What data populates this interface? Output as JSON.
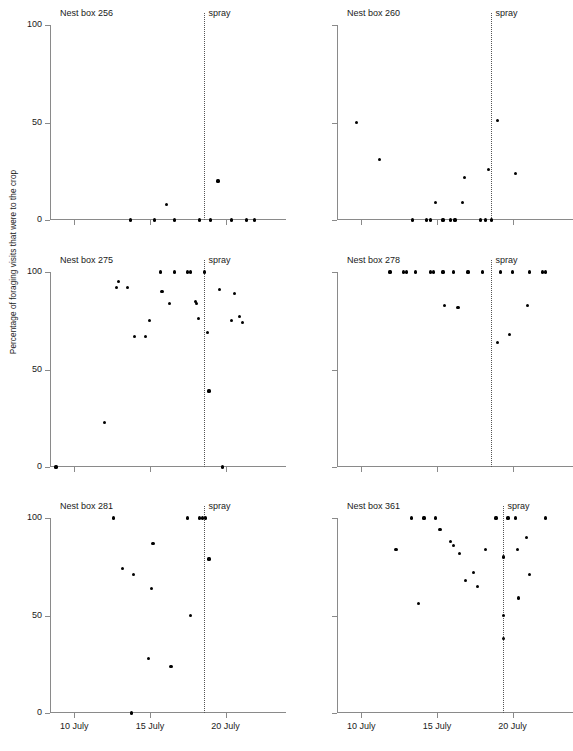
{
  "figure": {
    "caption_remnant": "",
    "y_axis_title": "Percentage of foraging visits that were to the crop",
    "spray_label": "spray",
    "point_color": "#000000",
    "axis_color": "#8a8a8a",
    "spray_line_color": "#555555"
  },
  "axes": {
    "y_ticks": [
      {
        "value": 0,
        "label": "0"
      },
      {
        "value": 50,
        "label": "50"
      },
      {
        "value": 100,
        "label": "100"
      }
    ],
    "x_ticks": [
      {
        "value": 10,
        "label": "10 July"
      },
      {
        "value": 15,
        "label": "15 July"
      },
      {
        "value": 20,
        "label": "20 July"
      }
    ],
    "xlim": [
      8.4,
      23.2
    ],
    "ylim": [
      0,
      100
    ],
    "xlabel": "",
    "ylabel": "Percentage of foraging visits that were to the crop",
    "grid": false
  },
  "chart_data": {
    "type": "scatter",
    "xlabel": "Date (July)",
    "ylabel": "Percentage of foraging visits that were to the crop",
    "xlim": [
      8.4,
      23.2
    ],
    "ylim": [
      0,
      100
    ],
    "x_tick_values": [
      10,
      15,
      20
    ],
    "x_tick_labels": [
      "10 July",
      "15 July",
      "20 July"
    ],
    "y_tick_values": [
      0,
      50,
      100
    ],
    "y_tick_labels": [
      "0",
      "50",
      "100"
    ],
    "grid": false,
    "legend": "none",
    "annotation": {
      "label": "spray",
      "type": "vertical-dotted-line"
    },
    "panels": [
      {
        "name": "Nest box 256",
        "spray_x": 18.6,
        "points": [
          {
            "x": 13.7,
            "y": 0
          },
          {
            "x": 15.3,
            "y": 0
          },
          {
            "x": 16.1,
            "y": 8
          },
          {
            "x": 16.6,
            "y": 0
          },
          {
            "x": 18.3,
            "y": 0
          },
          {
            "x": 19.0,
            "y": 0
          },
          {
            "x": 19.5,
            "y": 20
          },
          {
            "x": 20.4,
            "y": 0
          },
          {
            "x": 21.4,
            "y": 0
          },
          {
            "x": 21.9,
            "y": 0
          }
        ]
      },
      {
        "name": "Nest box 260",
        "spray_x": 18.6,
        "points": [
          {
            "x": 9.7,
            "y": 50
          },
          {
            "x": 11.2,
            "y": 31
          },
          {
            "x": 13.4,
            "y": 0
          },
          {
            "x": 14.3,
            "y": 0
          },
          {
            "x": 14.6,
            "y": 0
          },
          {
            "x": 14.9,
            "y": 9
          },
          {
            "x": 15.4,
            "y": 0
          },
          {
            "x": 15.9,
            "y": 0
          },
          {
            "x": 16.2,
            "y": 0
          },
          {
            "x": 16.7,
            "y": 9
          },
          {
            "x": 16.8,
            "y": 22
          },
          {
            "x": 17.9,
            "y": 0
          },
          {
            "x": 18.2,
            "y": 0
          },
          {
            "x": 18.4,
            "y": 26
          },
          {
            "x": 18.6,
            "y": 0
          },
          {
            "x": 19.0,
            "y": 51
          },
          {
            "x": 20.2,
            "y": 24
          }
        ]
      },
      {
        "name": "Nest box 275",
        "spray_x": 18.6,
        "points": [
          {
            "x": 8.8,
            "y": 0
          },
          {
            "x": 12.0,
            "y": 23
          },
          {
            "x": 12.8,
            "y": 92
          },
          {
            "x": 12.9,
            "y": 95
          },
          {
            "x": 13.5,
            "y": 92
          },
          {
            "x": 14.0,
            "y": 67
          },
          {
            "x": 14.7,
            "y": 67
          },
          {
            "x": 15.0,
            "y": 75
          },
          {
            "x": 15.7,
            "y": 100
          },
          {
            "x": 15.8,
            "y": 90
          },
          {
            "x": 16.3,
            "y": 84
          },
          {
            "x": 16.6,
            "y": 100
          },
          {
            "x": 17.5,
            "y": 100
          },
          {
            "x": 17.7,
            "y": 100
          },
          {
            "x": 18.0,
            "y": 85
          },
          {
            "x": 18.1,
            "y": 84
          },
          {
            "x": 18.2,
            "y": 76
          },
          {
            "x": 18.6,
            "y": 100
          },
          {
            "x": 18.8,
            "y": 69
          },
          {
            "x": 18.9,
            "y": 39
          },
          {
            "x": 19.6,
            "y": 91
          },
          {
            "x": 19.8,
            "y": 0
          },
          {
            "x": 20.4,
            "y": 75
          },
          {
            "x": 20.6,
            "y": 89
          },
          {
            "x": 20.9,
            "y": 77
          },
          {
            "x": 21.1,
            "y": 74
          }
        ]
      },
      {
        "name": "Nest box 278",
        "spray_x": 18.6,
        "points": [
          {
            "x": 11.9,
            "y": 100
          },
          {
            "x": 12.8,
            "y": 100
          },
          {
            "x": 13.0,
            "y": 100
          },
          {
            "x": 13.6,
            "y": 100
          },
          {
            "x": 14.6,
            "y": 100
          },
          {
            "x": 14.8,
            "y": 100
          },
          {
            "x": 15.4,
            "y": 100
          },
          {
            "x": 15.5,
            "y": 83
          },
          {
            "x": 16.1,
            "y": 100
          },
          {
            "x": 16.4,
            "y": 82
          },
          {
            "x": 17.0,
            "y": 100
          },
          {
            "x": 17.1,
            "y": 100
          },
          {
            "x": 18.0,
            "y": 100
          },
          {
            "x": 19.0,
            "y": 64
          },
          {
            "x": 19.2,
            "y": 100
          },
          {
            "x": 19.8,
            "y": 68
          },
          {
            "x": 20.0,
            "y": 100
          },
          {
            "x": 21.0,
            "y": 83
          },
          {
            "x": 21.1,
            "y": 100
          },
          {
            "x": 22.0,
            "y": 100
          },
          {
            "x": 22.2,
            "y": 100
          }
        ]
      },
      {
        "name": "Nest box 281",
        "spray_x": 18.6,
        "points": [
          {
            "x": 12.6,
            "y": 100
          },
          {
            "x": 13.2,
            "y": 74
          },
          {
            "x": 13.8,
            "y": 0
          },
          {
            "x": 13.9,
            "y": 71
          },
          {
            "x": 14.9,
            "y": 28
          },
          {
            "x": 15.1,
            "y": 64
          },
          {
            "x": 15.2,
            "y": 87
          },
          {
            "x": 16.4,
            "y": 24
          },
          {
            "x": 17.5,
            "y": 100
          },
          {
            "x": 17.7,
            "y": 50
          },
          {
            "x": 18.3,
            "y": 100
          },
          {
            "x": 18.5,
            "y": 100
          },
          {
            "x": 18.7,
            "y": 100
          },
          {
            "x": 18.9,
            "y": 79
          }
        ]
      },
      {
        "name": "Nest box 361",
        "spray_x": 19.4,
        "points": [
          {
            "x": 12.3,
            "y": 84
          },
          {
            "x": 13.3,
            "y": 100
          },
          {
            "x": 13.8,
            "y": 56
          },
          {
            "x": 14.1,
            "y": 100
          },
          {
            "x": 14.2,
            "y": 100
          },
          {
            "x": 14.9,
            "y": 100
          },
          {
            "x": 15.2,
            "y": 94
          },
          {
            "x": 15.9,
            "y": 88
          },
          {
            "x": 16.1,
            "y": 86
          },
          {
            "x": 16.5,
            "y": 82
          },
          {
            "x": 16.9,
            "y": 68
          },
          {
            "x": 17.4,
            "y": 72
          },
          {
            "x": 17.7,
            "y": 65
          },
          {
            "x": 18.2,
            "y": 84
          },
          {
            "x": 18.9,
            "y": 100
          },
          {
            "x": 19.4,
            "y": 80
          },
          {
            "x": 19.4,
            "y": 50
          },
          {
            "x": 19.4,
            "y": 38
          },
          {
            "x": 19.7,
            "y": 100
          },
          {
            "x": 20.2,
            "y": 100
          },
          {
            "x": 20.3,
            "y": 84
          },
          {
            "x": 20.4,
            "y": 59
          },
          {
            "x": 20.9,
            "y": 90
          },
          {
            "x": 21.1,
            "y": 71
          },
          {
            "x": 22.2,
            "y": 100
          }
        ]
      }
    ]
  }
}
